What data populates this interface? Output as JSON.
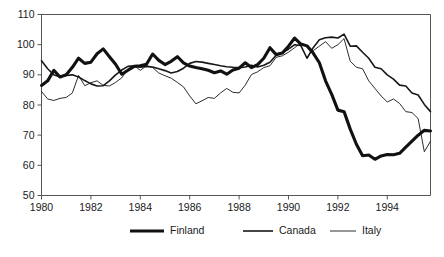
{
  "chart_data": {
    "type": "line",
    "title": "",
    "subtitle": "",
    "xlabel": "",
    "ylabel": "",
    "xlim": [
      1980,
      1995.75
    ],
    "ylim": [
      50,
      110
    ],
    "xticks": [
      1980,
      1982,
      1984,
      1986,
      1988,
      1990,
      1992,
      1994
    ],
    "xtick_labels": [
      "1980",
      "1982",
      "1984",
      "1986",
      "1988",
      "1990",
      "1992",
      "1994"
    ],
    "yticks": [
      50,
      60,
      70,
      80,
      90,
      100,
      110
    ],
    "ytick_labels": [
      "50",
      "60",
      "70",
      "80",
      "90",
      "100",
      "110"
    ],
    "grid": false,
    "legend_position": "bottom-center",
    "x": [
      1980,
      1980.25,
      1980.5,
      1980.75,
      1981,
      1981.25,
      1981.5,
      1981.75,
      1982,
      1982.25,
      1982.5,
      1982.75,
      1983,
      1983.25,
      1983.5,
      1983.75,
      1984,
      1984.25,
      1984.5,
      1984.75,
      1985,
      1985.25,
      1985.5,
      1985.75,
      1986,
      1986.25,
      1986.5,
      1986.75,
      1987,
      1987.25,
      1987.5,
      1987.75,
      1988,
      1988.25,
      1988.5,
      1988.75,
      1989,
      1989.25,
      1989.5,
      1989.75,
      1990,
      1990.25,
      1990.5,
      1990.75,
      1991,
      1991.25,
      1991.5,
      1991.75,
      1992,
      1992.25,
      1992.5,
      1992.75,
      1993,
      1993.25,
      1993.5,
      1993.75,
      1994,
      1994.25,
      1994.5,
      1994.75,
      1995,
      1995.25,
      1995.5,
      1995.75
    ],
    "series": [
      {
        "name": "Finland",
        "style": "thick",
        "color": "#111111",
        "width": 3.1,
        "values": [
          86.5,
          88.0,
          91.5,
          89.3,
          90.0,
          92.5,
          95.5,
          93.8,
          94.2,
          97.0,
          98.6,
          96.0,
          93.5,
          90.2,
          91.5,
          92.8,
          93.0,
          93.5,
          96.9,
          94.8,
          93.4,
          94.5,
          96.0,
          94.0,
          92.9,
          92.4,
          92.0,
          91.5,
          90.7,
          91.3,
          90.2,
          91.6,
          92.2,
          94.0,
          92.4,
          93.4,
          95.5,
          99.0,
          96.7,
          97.2,
          99.5,
          102.2,
          100.2,
          99.6,
          97.2,
          94.0,
          88.0,
          83.5,
          78.3,
          77.8,
          72.0,
          67.0,
          63.2,
          63.4,
          62.0,
          63.1,
          63.6,
          63.5,
          64.0,
          66.0,
          68.0,
          70.0,
          71.6,
          71.4
        ]
      },
      {
        "name": "Canada",
        "style": "medium",
        "color": "#181818",
        "width": 1.6,
        "values": [
          94.7,
          92.0,
          90.0,
          89.3,
          89.8,
          90.0,
          89.3,
          88.1,
          87.0,
          86.3,
          86.4,
          88.0,
          90.0,
          91.6,
          92.8,
          93.0,
          92.5,
          92.8,
          92.6,
          92.0,
          91.4,
          90.6,
          91.1,
          92.2,
          93.8,
          94.4,
          94.2,
          93.8,
          93.4,
          93.0,
          92.7,
          92.5,
          92.4,
          92.6,
          93.2,
          92.6,
          93.2,
          94.2,
          96.5,
          97.4,
          98.5,
          100.0,
          99.7,
          95.5,
          99.0,
          101.6,
          102.3,
          102.5,
          102.2,
          103.5,
          99.5,
          99.6,
          97.5,
          95.5,
          92.5,
          92.0,
          90.0,
          88.6,
          86.6,
          86.3,
          84.0,
          83.3,
          80.2,
          77.8
        ]
      },
      {
        "name": "Italy",
        "style": "thin",
        "color": "#222222",
        "width": 0.95,
        "values": [
          84.5,
          82.0,
          81.5,
          82.2,
          82.5,
          84.0,
          89.8,
          86.4,
          87.4,
          88.0,
          86.5,
          86.3,
          87.5,
          89.0,
          92.0,
          93.0,
          91.5,
          93.0,
          92.4,
          90.6,
          89.7,
          88.9,
          87.5,
          86.0,
          83.0,
          80.4,
          81.4,
          82.5,
          82.2,
          84.0,
          85.5,
          84.2,
          84.0,
          86.6,
          90.1,
          91.0,
          92.4,
          93.0,
          95.8,
          96.3,
          97.5,
          99.0,
          100.5,
          99.6,
          98.0,
          99.5,
          101.0,
          98.8,
          100.0,
          102.0,
          94.5,
          92.5,
          92.0,
          88.0,
          85.5,
          83.0,
          81.0,
          82.0,
          80.5,
          77.8,
          77.5,
          75.5,
          64.5,
          68.0
        ]
      }
    ]
  },
  "legend": {
    "items": [
      {
        "label": "Finland"
      },
      {
        "label": "Canada"
      },
      {
        "label": "Italy"
      }
    ]
  }
}
